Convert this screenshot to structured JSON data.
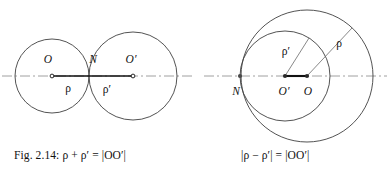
{
  "figure": {
    "background_color": "#ffffff",
    "stroke_color": "#3a3a3a",
    "axis_color": "#9a9a9a",
    "segment_color": "#111111",
    "panels": [
      {
        "id": "external-tangency",
        "name": "externally-tangent-circles",
        "caption": "Fig. 2.14: ρ + ρ′ = |OO′|",
        "axis": {
          "y": 76,
          "x_start": 2,
          "x_end": 192,
          "style": "dash-dot"
        },
        "circles": [
          {
            "label": "O",
            "cx": 52,
            "cy": 76,
            "r": 37
          },
          {
            "label": "O′",
            "cx": 133,
            "cy": 76,
            "r": 44
          }
        ],
        "points": [
          {
            "label": "O",
            "x": 52,
            "y": 76,
            "label_x": 48,
            "label_y": 62,
            "marker": "open"
          },
          {
            "label": "N",
            "x": 89,
            "y": 76,
            "label_x": 92,
            "label_y": 62,
            "marker": "none"
          },
          {
            "label": "O′",
            "x": 133,
            "y": 76,
            "label_x": 128,
            "label_y": 62,
            "marker": "open"
          }
        ],
        "segments": [
          {
            "label": "ρ",
            "x1": 52,
            "y1": 76,
            "x2": 89,
            "y2": 76,
            "label_x": 67,
            "label_y": 91
          },
          {
            "label": "ρ′",
            "x1": 89,
            "y1": 76,
            "x2": 133,
            "y2": 76,
            "label_x": 106,
            "label_y": 92
          }
        ]
      },
      {
        "id": "internal-tangency",
        "name": "internally-tangent-circles",
        "caption": "|ρ − ρ′| = |OO′|",
        "axis": {
          "y": 76,
          "x_start": 204,
          "x_end": 387,
          "style": "dash-dot"
        },
        "circles": [
          {
            "label": "O",
            "cx": 307,
            "cy": 76,
            "r": 66
          },
          {
            "label": "O′",
            "cx": 285,
            "cy": 76,
            "r": 45
          }
        ],
        "points": [
          {
            "label": "N",
            "x": 240,
            "y": 76,
            "label_x": 234,
            "label_y": 93,
            "marker": "solid"
          },
          {
            "label": "O′",
            "x": 285,
            "y": 76,
            "label_x": 278,
            "label_y": 93,
            "marker": "solid"
          },
          {
            "label": "O",
            "x": 307,
            "y": 76,
            "label_x": 303,
            "label_y": 93,
            "marker": "solid"
          }
        ],
        "segments": [
          {
            "label": "ρ",
            "x1": 307,
            "y1": 76,
            "x2": 352,
            "y2": 28,
            "label_x": 335,
            "label_y": 44
          },
          {
            "label": "ρ′",
            "x1": 285,
            "y1": 76,
            "x2": 308,
            "y2": 38,
            "label_x": 285,
            "label_y": 52
          },
          {
            "label": "OO′",
            "x1": 285,
            "y1": 76,
            "x2": 307,
            "y2": 76,
            "label_x": 0,
            "label_y": 0
          }
        ]
      }
    ]
  },
  "captions": {
    "left": "Fig. 2.14: ρ + ρ′ = |OO′|",
    "right": "|ρ − ρ′| = |OO′|"
  },
  "labels": {
    "left_panel": {
      "center_O": "O",
      "tangent_N": "N",
      "center_Oprime": "O′",
      "radius_rho": "ρ",
      "radius_rho_prime": "ρ′"
    },
    "right_panel": {
      "tangent_N": "N",
      "center_Oprime": "O′",
      "center_O": "O",
      "radius_rho": "ρ",
      "radius_rho_prime": "ρ′"
    }
  }
}
